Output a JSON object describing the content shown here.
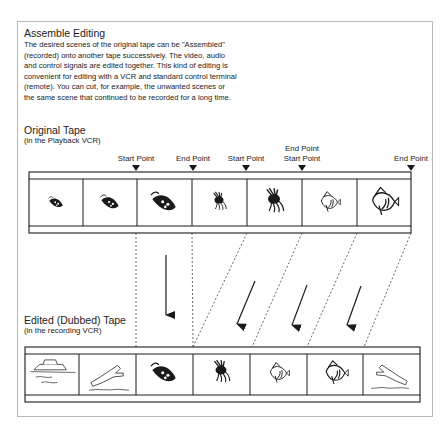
{
  "heading": {
    "title": "Assemble Editing",
    "body_lines": [
      "The desired scenes of the original tape can be \"Assembled\"",
      "(recorded) onto another tape successively. The video, audio",
      "and control signals are edited together. This kind of editing is",
      "convenient for editing with a VCR and standard control terminal",
      "(remote). You can cut, for example, the unwanted scenes or",
      "the same scene that continued to be recorded for a long time."
    ]
  },
  "original_tape": {
    "title": "Original Tape",
    "subtitle": "(in the Playback VCR)",
    "markers": [
      {
        "label": "Start Point",
        "label2": ""
      },
      {
        "label": "End Point",
        "label2": ""
      },
      {
        "label": "Start Point",
        "label2": ""
      },
      {
        "label": "End Point",
        "label2": "Start Point"
      },
      {
        "label": "End Point",
        "label2": ""
      }
    ],
    "frames": [
      "small-fish-icon",
      "fish-icon",
      "large-fish-icon",
      "small-lionfish-icon",
      "lionfish-icon",
      "angelfish-icon",
      "large-angelfish-icon"
    ]
  },
  "edited_tape": {
    "title": "Edited (Dubbed) Tape",
    "subtitle": "(in the recording VCR)",
    "frames": [
      "boat-icon",
      "diver-icon",
      "large-fish-icon",
      "lionfish-icon",
      "angelfish-icon",
      "large-angelfish-icon",
      "diver-icon"
    ]
  },
  "colors": {
    "line": "#1a1a1a",
    "frame_border": "#b8b8b8"
  }
}
